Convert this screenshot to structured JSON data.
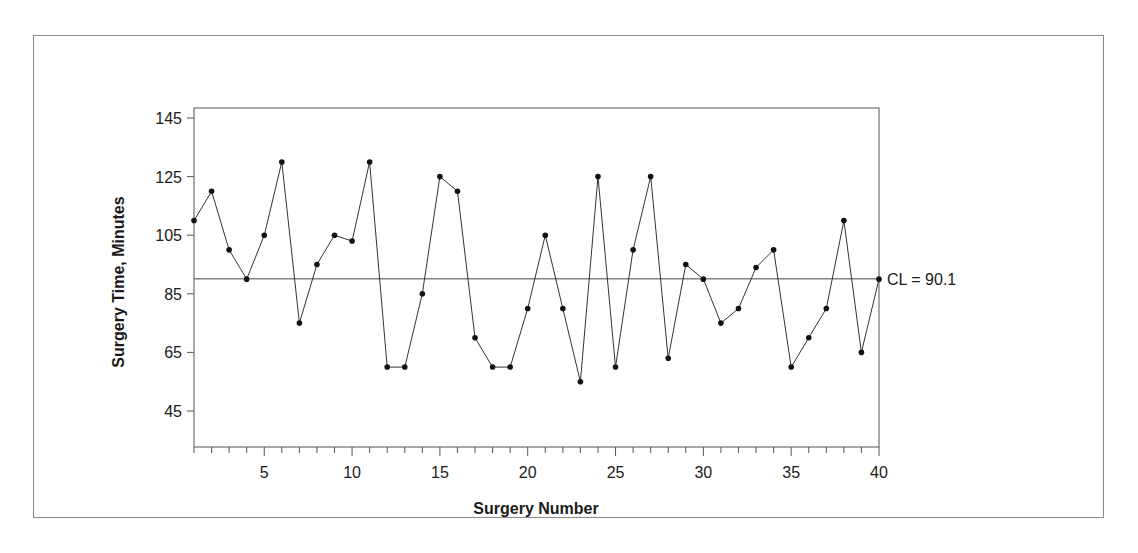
{
  "chart_data": {
    "type": "line",
    "title": "",
    "xlabel": "Surgery Number",
    "ylabel": "Surgery Time, Minutes",
    "xlim": [
      1,
      40
    ],
    "ylim": [
      33,
      148
    ],
    "x_ticks": [
      5,
      10,
      15,
      20,
      25,
      30,
      35,
      40
    ],
    "y_ticks": [
      45,
      65,
      85,
      105,
      125,
      145
    ],
    "grid": false,
    "legend": null,
    "center_line": {
      "value": 90.1,
      "label": "CL = 90.1"
    },
    "x": [
      1,
      2,
      3,
      4,
      5,
      6,
      7,
      8,
      9,
      10,
      11,
      12,
      13,
      14,
      15,
      16,
      17,
      18,
      19,
      20,
      21,
      22,
      23,
      24,
      25,
      26,
      27,
      28,
      29,
      30,
      31,
      32,
      33,
      34,
      35,
      36,
      37,
      38,
      39,
      40
    ],
    "series": [
      {
        "name": "Surgery Time",
        "values": [
          110,
          120,
          100,
          90,
          105,
          130,
          75,
          95,
          105,
          103,
          130,
          60,
          60,
          85,
          125,
          120,
          70,
          60,
          60,
          80,
          105,
          80,
          55,
          125,
          60,
          100,
          125,
          63,
          95,
          90,
          75,
          80,
          94,
          100,
          60,
          70,
          80,
          110,
          65,
          90
        ]
      }
    ]
  },
  "labels": {
    "xlabel": "Surgery Number",
    "ylabel": "Surgery Time, Minutes",
    "cl": "CL = 90.1"
  }
}
